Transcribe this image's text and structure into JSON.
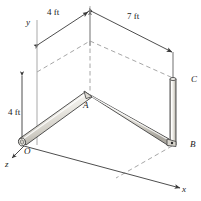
{
  "figure": {
    "type": "engineering-diagram",
    "colors": {
      "line": "#3a3a3a",
      "pipe_fill": "#e8e6e0",
      "pipe_highlight": "#f7f6f3",
      "pipe_shadow": "#b9b6ae",
      "dashed": "#8a8a8a",
      "guide": "#9b9b9b",
      "background": "#ffffff",
      "text": "#1a1a1a"
    },
    "dimensions": [
      {
        "id": "dim-oa-top",
        "label": "4 ft",
        "x": 47,
        "y": 8
      },
      {
        "id": "dim-ab-top",
        "label": "7 ft",
        "x": 127,
        "y": 12
      },
      {
        "id": "dim-height",
        "label": "4 ft",
        "x": 8,
        "y": 108
      }
    ],
    "points": [
      {
        "id": "point-o",
        "label": "O",
        "x": 24,
        "y": 147
      },
      {
        "id": "point-a",
        "label": "A",
        "x": 83,
        "y": 101
      },
      {
        "id": "point-b",
        "label": "B",
        "x": 190,
        "y": 140
      },
      {
        "id": "point-c",
        "label": "C",
        "x": 191,
        "y": 75
      }
    ],
    "axes": [
      {
        "id": "axis-x",
        "label": "x",
        "x": 182,
        "y": 185
      },
      {
        "id": "axis-y",
        "label": "y",
        "x": 26,
        "y": 18
      },
      {
        "id": "axis-z",
        "label": "z",
        "x": 5,
        "y": 160
      }
    ]
  }
}
